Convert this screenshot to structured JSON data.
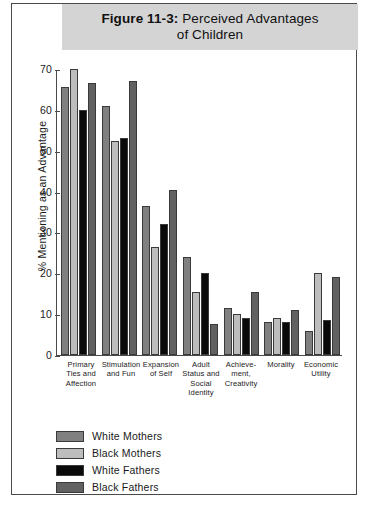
{
  "figure": {
    "number": "Figure 11-3:",
    "title_rest": " Perceived Advantages",
    "title_line2": "of Children"
  },
  "chart_data": {
    "type": "bar",
    "title": "Figure 11-3: Perceived Advantages of Children",
    "xlabel": "",
    "ylabel": "% Mentioning as an Advantage",
    "ylim": [
      0,
      70
    ],
    "yticks": [
      "0",
      "10",
      "20",
      "30",
      "40",
      "50",
      "60",
      "70"
    ],
    "grid": false,
    "legend_position": "bottom-left",
    "categories": [
      "Primary Ties and Affection",
      "Stimulation and Fun",
      "Expansion of Self",
      "Adult Status and Social Identity",
      "Achievement, Creativity",
      "Morality",
      "Economic Utility"
    ],
    "category_lines": [
      [
        "Primary",
        "Ties and",
        "Affection"
      ],
      [
        "Stimulation",
        "and Fun"
      ],
      [
        "Expansion",
        "of Self"
      ],
      [
        "Adult",
        "Status and",
        "Social",
        "Identity"
      ],
      [
        "Achieve-",
        "ment,",
        "Creativity"
      ],
      [
        "Morality"
      ],
      [
        "Economic",
        "Utility"
      ]
    ],
    "series": [
      {
        "name": "White Mothers",
        "color": "#808080",
        "values": [
          65.5,
          61,
          36.5,
          24,
          11.5,
          8,
          6
        ]
      },
      {
        "name": "Black Mothers",
        "color": "#bdbdbd",
        "values": [
          70,
          52.5,
          26.5,
          15.5,
          10,
          9,
          20
        ]
      },
      {
        "name": "White Fathers",
        "color": "#0a0a0a",
        "values": [
          60,
          53,
          32,
          20,
          9,
          8,
          8.5
        ]
      },
      {
        "name": "Black Fathers",
        "color": "#616161",
        "values": [
          66.5,
          67,
          40.5,
          7.5,
          15.5,
          11,
          19
        ]
      }
    ]
  },
  "colors": {
    "banner": "#d4d4d4",
    "axis": "#4a4a4a",
    "frame": "#4a4a4a"
  }
}
